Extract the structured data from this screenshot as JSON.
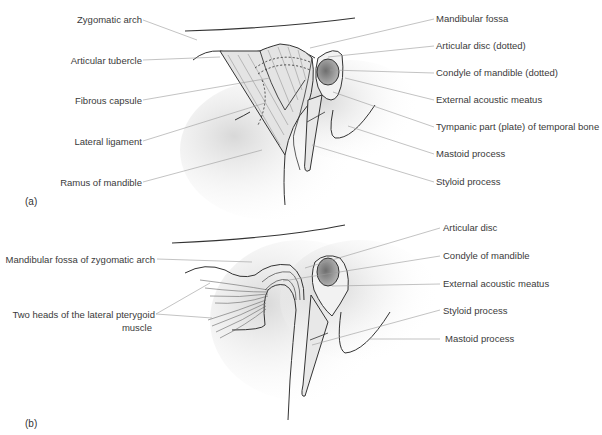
{
  "figure": {
    "panels": [
      {
        "id": "a",
        "label": "(a)",
        "left_labels": [
          {
            "text": "Zygomatic arch"
          },
          {
            "text": "Articular tubercle"
          },
          {
            "text": "Fibrous capsule"
          },
          {
            "text": "Lateral ligament"
          },
          {
            "text": "Ramus of mandible"
          }
        ],
        "right_labels": [
          {
            "text": "Mandibular fossa"
          },
          {
            "text": "Articular disc (dotted)"
          },
          {
            "text": "Condyle of mandible (dotted)"
          },
          {
            "text": "External acoustic meatus"
          },
          {
            "text": "Tympanic part (plate) of temporal bone"
          },
          {
            "text": "Mastoid process"
          },
          {
            "text": "Styloid process"
          }
        ]
      },
      {
        "id": "b",
        "label": "(b)",
        "left_labels": [
          {
            "text": "Mandibular fossa of zygomatic arch"
          },
          {
            "text": "Two heads of the lateral pterygoid",
            "text2": "muscle"
          }
        ],
        "right_labels": [
          {
            "text": "Articular disc"
          },
          {
            "text": "Condyle of mandible"
          },
          {
            "text": "External acoustic meatus"
          },
          {
            "text": "Styloid process"
          },
          {
            "text": "Mastoid process"
          }
        ]
      }
    ],
    "colors": {
      "line": "#333333",
      "leader": "#9a9a9a",
      "fill_light": "#e6e6e6",
      "fill_condyle": "#8c8c8c"
    }
  }
}
